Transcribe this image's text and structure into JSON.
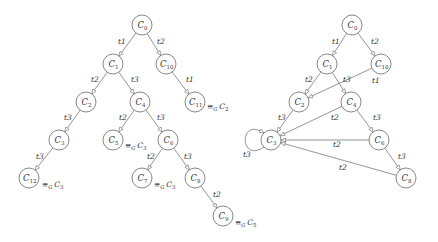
{
  "diagrams": [
    {
      "name": "unfolding-tree",
      "nodes": [
        {
          "id": "C0",
          "base": "C",
          "sub": "0",
          "x": 142,
          "y": 25
        },
        {
          "id": "C1",
          "base": "C",
          "sub": "1",
          "x": 113,
          "y": 64
        },
        {
          "id": "C10",
          "base": "C",
          "sub": "10",
          "x": 166,
          "y": 64
        },
        {
          "id": "C2",
          "base": "C",
          "sub": "2",
          "x": 86,
          "y": 102
        },
        {
          "id": "C4",
          "base": "C",
          "sub": "4",
          "x": 140,
          "y": 102
        },
        {
          "id": "C11",
          "base": "C",
          "sub": "11",
          "x": 195,
          "y": 102
        },
        {
          "id": "C3",
          "base": "C",
          "sub": "3",
          "x": 59,
          "y": 140
        },
        {
          "id": "C5",
          "base": "C",
          "sub": "5",
          "x": 113,
          "y": 140
        },
        {
          "id": "C6",
          "base": "C",
          "sub": "6",
          "x": 168,
          "y": 140
        },
        {
          "id": "C12",
          "base": "C",
          "sub": "12",
          "x": 29,
          "y": 178
        },
        {
          "id": "C7",
          "base": "C",
          "sub": "7",
          "x": 142,
          "y": 178
        },
        {
          "id": "C8",
          "base": "C",
          "sub": "8",
          "x": 195,
          "y": 178
        },
        {
          "id": "C9",
          "base": "C",
          "sub": "9",
          "x": 223,
          "y": 216
        }
      ],
      "edges": [
        {
          "from": "C0",
          "to": "C1",
          "label": "t1",
          "lx": 118,
          "ly": 44
        },
        {
          "from": "C0",
          "to": "C10",
          "label": "t2",
          "lx": 157,
          "ly": 44
        },
        {
          "from": "C1",
          "to": "C2",
          "label": "t2",
          "lx": 91,
          "ly": 82
        },
        {
          "from": "C1",
          "to": "C4",
          "label": "t3",
          "lx": 131,
          "ly": 82
        },
        {
          "from": "C10",
          "to": "C11",
          "label": "t1",
          "lx": 186,
          "ly": 82
        },
        {
          "from": "C2",
          "to": "C3",
          "label": "t3",
          "lx": 64,
          "ly": 120
        },
        {
          "from": "C4",
          "to": "C5",
          "label": "t2",
          "lx": 119,
          "ly": 120
        },
        {
          "from": "C4",
          "to": "C6",
          "label": "t3",
          "lx": 157,
          "ly": 120
        },
        {
          "from": "C3",
          "to": "C12",
          "label": "t3",
          "lx": 36,
          "ly": 159
        },
        {
          "from": "C6",
          "to": "C7",
          "label": "t2",
          "lx": 147,
          "ly": 159
        },
        {
          "from": "C6",
          "to": "C8",
          "label": "t3",
          "lx": 184,
          "ly": 159
        },
        {
          "from": "C8",
          "to": "C9",
          "label": "t2",
          "lx": 213,
          "ly": 197
        }
      ],
      "equivalences": [
        {
          "node": "C11",
          "text": "≡",
          "sub": "G",
          "target_base": "C",
          "target_sub": "2",
          "x": 207,
          "y": 109
        },
        {
          "node": "C5",
          "text": "≡",
          "sub": "G",
          "target_base": "C",
          "target_sub": "3",
          "x": 125,
          "y": 148
        },
        {
          "node": "C12",
          "text": "≡",
          "sub": "G",
          "target_base": "C",
          "target_sub": "3",
          "x": 42,
          "y": 187
        },
        {
          "node": "C7",
          "text": "≡",
          "sub": "G",
          "target_base": "C",
          "target_sub": "3",
          "x": 154,
          "y": 187
        },
        {
          "node": "C9",
          "text": "≡",
          "sub": "G",
          "target_base": "C",
          "target_sub": "5",
          "x": 235,
          "y": 225
        }
      ]
    },
    {
      "name": "folded-graph",
      "nodes": [
        {
          "id": "C0",
          "base": "C",
          "sub": "0",
          "x": 352,
          "y": 25
        },
        {
          "id": "C1",
          "base": "C",
          "sub": "1",
          "x": 327,
          "y": 64
        },
        {
          "id": "C10",
          "base": "C",
          "sub": "10",
          "x": 381,
          "y": 64
        },
        {
          "id": "C2",
          "base": "C",
          "sub": "2",
          "x": 299,
          "y": 102
        },
        {
          "id": "C4",
          "base": "C",
          "sub": "4",
          "x": 351,
          "y": 102
        },
        {
          "id": "C3",
          "base": "C",
          "sub": "3",
          "x": 271,
          "y": 140
        },
        {
          "id": "C6",
          "base": "C",
          "sub": "6",
          "x": 379,
          "y": 140
        },
        {
          "id": "C8",
          "base": "C",
          "sub": "8",
          "x": 406,
          "y": 178
        }
      ],
      "edges": [
        {
          "from": "C0",
          "to": "C1",
          "label": "t1",
          "lx": 332,
          "ly": 44
        },
        {
          "from": "C0",
          "to": "C10",
          "label": "t2",
          "lx": 371,
          "ly": 44
        },
        {
          "from": "C1",
          "to": "C2",
          "label": "t2",
          "lx": 305,
          "ly": 82
        },
        {
          "from": "C1",
          "to": "C4",
          "label": "t3",
          "lx": 343,
          "ly": 82
        },
        {
          "from": "C10",
          "to": "C2",
          "label": "t1",
          "lx": 372,
          "ly": 83
        },
        {
          "from": "C2",
          "to": "C3",
          "label": "t3",
          "lx": 278,
          "ly": 120
        },
        {
          "from": "C4",
          "to": "C3",
          "label": "t2",
          "lx": 331,
          "ly": 120
        },
        {
          "from": "C4",
          "to": "C6",
          "label": "t3",
          "lx": 373,
          "ly": 120
        },
        {
          "from": "C6",
          "to": "C3",
          "label": "t2",
          "lx": 333,
          "ly": 147
        },
        {
          "from": "C6",
          "to": "C8",
          "label": "t3",
          "lx": 398,
          "ly": 159
        },
        {
          "from": "C8",
          "to": "C3",
          "label": "t2",
          "lx": 339,
          "ly": 170
        }
      ],
      "self_loops": [
        {
          "node": "C3",
          "label": "t3",
          "lx": 243,
          "ly": 157
        }
      ]
    }
  ]
}
